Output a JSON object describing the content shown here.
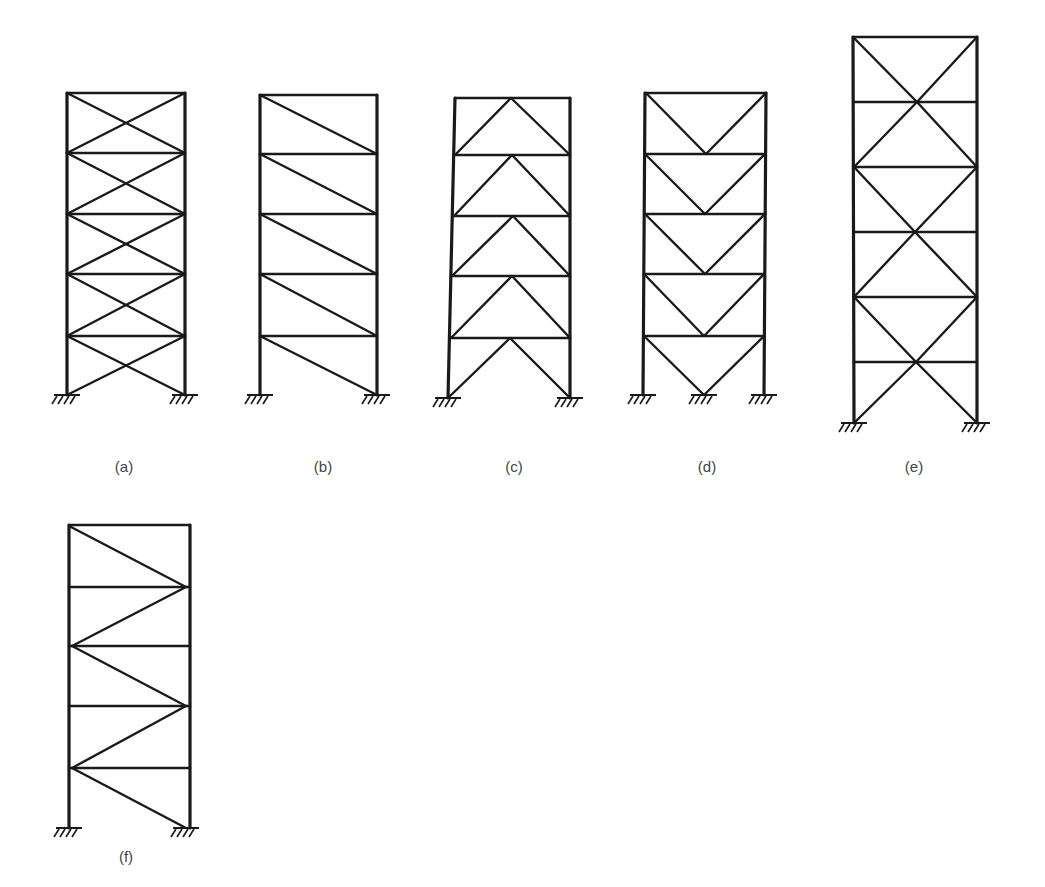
{
  "figure": {
    "type": "structural-bracing-systems",
    "frames": [
      {
        "id": "a",
        "label": "(a)",
        "label_pos": [
          124,
          468
        ],
        "bracing": "x-bracing-per-story",
        "columns": {
          "left": {
            "x_top": 67,
            "x_bot": 67
          },
          "right": {
            "x_top": 185,
            "x_bot": 185
          }
        },
        "floors_y": [
          93,
          153,
          214,
          274,
          336
        ],
        "base_y": 395,
        "braces": [
          [
            67,
            93,
            185,
            153
          ],
          [
            185,
            93,
            67,
            153
          ],
          [
            67,
            153,
            185,
            214
          ],
          [
            185,
            153,
            67,
            214
          ],
          [
            67,
            214,
            185,
            274
          ],
          [
            185,
            214,
            67,
            274
          ],
          [
            67,
            274,
            185,
            336
          ],
          [
            185,
            274,
            67,
            336
          ],
          [
            67,
            336,
            185,
            395
          ],
          [
            185,
            336,
            67,
            395
          ]
        ],
        "supports": [
          67,
          185
        ]
      },
      {
        "id": "b",
        "label": "(b)",
        "label_pos": [
          323,
          468
        ],
        "bracing": "single-diagonal",
        "columns": {
          "left": {
            "x_top": 260,
            "x_bot": 260
          },
          "right": {
            "x_top": 377,
            "x_bot": 377
          }
        },
        "floors_y": [
          95,
          154,
          214,
          274,
          336
        ],
        "base_y": 395,
        "braces": [
          [
            260,
            95,
            377,
            154
          ],
          [
            260,
            154,
            377,
            214
          ],
          [
            260,
            214,
            377,
            274
          ],
          [
            260,
            274,
            377,
            336
          ],
          [
            260,
            336,
            377,
            395
          ]
        ],
        "supports": [
          260,
          377
        ]
      },
      {
        "id": "c",
        "label": "(c)",
        "label_pos": [
          514,
          468
        ],
        "bracing": "chevron-inverted-v",
        "columns": {
          "left": {
            "x_top": 455,
            "x_bot": 448
          },
          "right": {
            "x_top": 570,
            "x_bot": 570
          }
        },
        "floors_y": [
          98,
          155,
          216,
          276,
          338
        ],
        "base_y": 398,
        "braces": [
          [
            455,
            155,
            511,
            98
          ],
          [
            511,
            98,
            570,
            155
          ],
          [
            454,
            216,
            512,
            155
          ],
          [
            512,
            155,
            570,
            216
          ],
          [
            452,
            276,
            513,
            216
          ],
          [
            513,
            216,
            570,
            276
          ],
          [
            451,
            338,
            512,
            276
          ],
          [
            512,
            276,
            570,
            338
          ],
          [
            448,
            398,
            510,
            338
          ],
          [
            510,
            338,
            570,
            398
          ]
        ],
        "supports": [
          448,
          570
        ]
      },
      {
        "id": "d",
        "label": "(d)",
        "label_pos": [
          707,
          468
        ],
        "bracing": "v-bracing",
        "columns": {
          "left": {
            "x_top": 645,
            "x_bot": 643
          },
          "right": {
            "x_top": 766,
            "x_bot": 764
          }
        },
        "floors_y": [
          93,
          154,
          214,
          274,
          336
        ],
        "base_y": 395,
        "braces": [
          [
            646,
            93,
            706,
            154
          ],
          [
            706,
            154,
            766,
            93
          ],
          [
            645,
            154,
            705,
            214
          ],
          [
            705,
            214,
            765,
            154
          ],
          [
            645,
            214,
            705,
            274
          ],
          [
            705,
            274,
            765,
            214
          ],
          [
            644,
            274,
            704,
            336
          ],
          [
            704,
            336,
            764,
            274
          ],
          [
            644,
            336,
            704,
            395
          ],
          [
            704,
            395,
            764,
            336
          ]
        ],
        "supports": [
          643,
          704,
          764
        ]
      },
      {
        "id": "e",
        "label": "(e)",
        "label_pos": [
          914,
          468
        ],
        "bracing": "two-story-x-bracing",
        "columns": {
          "left": {
            "x_top": 853,
            "x_bot": 854
          },
          "right": {
            "x_top": 977,
            "x_bot": 977
          }
        },
        "floors_y": [
          37,
          102,
          167,
          232,
          297,
          362
        ],
        "base_y": 423,
        "braces": [
          [
            853,
            37,
            917,
            102
          ],
          [
            917,
            102,
            977,
            167
          ],
          [
            977,
            37,
            917,
            102
          ],
          [
            917,
            102,
            854,
            167
          ],
          [
            854,
            167,
            915,
            232
          ],
          [
            915,
            232,
            977,
            297
          ],
          [
            977,
            167,
            915,
            232
          ],
          [
            915,
            232,
            854,
            297
          ],
          [
            854,
            297,
            916,
            362
          ],
          [
            916,
            362,
            977,
            423
          ],
          [
            977,
            297,
            916,
            362
          ],
          [
            916,
            362,
            854,
            423
          ]
        ],
        "supports": [
          854,
          977
        ]
      },
      {
        "id": "f",
        "label": "(f)",
        "label_pos": [
          126,
          858
        ],
        "bracing": "zigzag-diagonal",
        "columns": {
          "left": {
            "x_top": 69,
            "x_bot": 69
          },
          "right": {
            "x_top": 190,
            "x_bot": 190
          }
        },
        "floors_y": [
          525,
          587,
          646,
          706,
          768
        ],
        "base_y": 828,
        "braces": [
          [
            71,
            527,
            186,
            587
          ],
          [
            186,
            587,
            72,
            646
          ],
          [
            72,
            646,
            186,
            706
          ],
          [
            186,
            706,
            72,
            768
          ],
          [
            72,
            768,
            186,
            828
          ]
        ],
        "supports": [
          69,
          186
        ]
      }
    ]
  }
}
